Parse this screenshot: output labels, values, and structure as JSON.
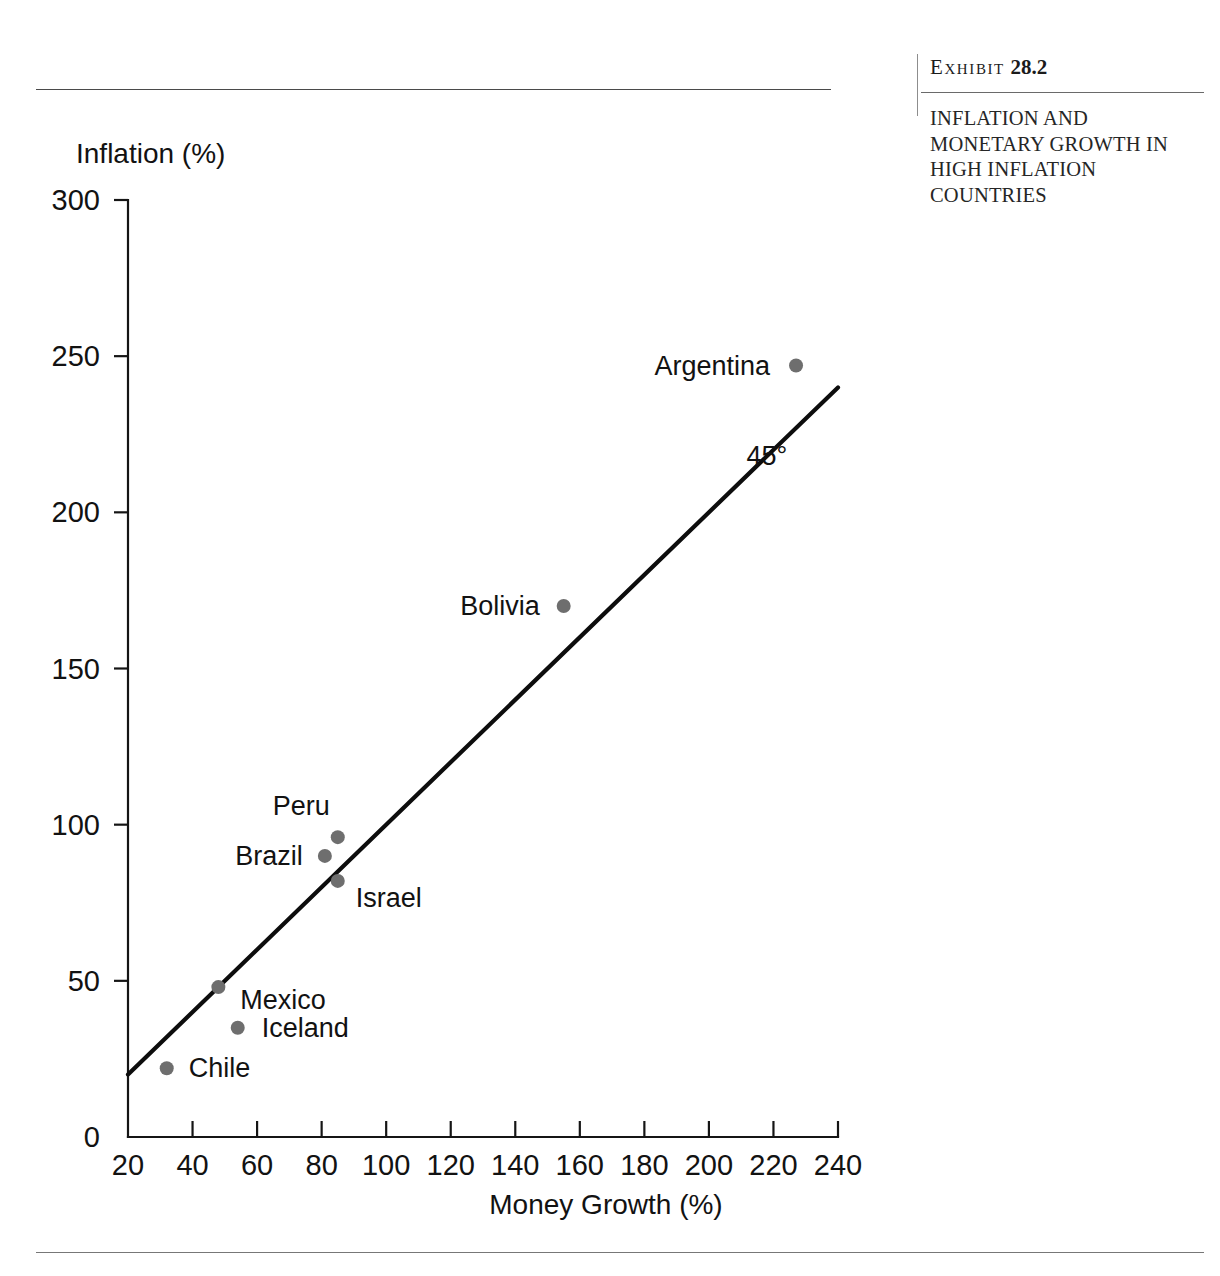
{
  "exhibit": {
    "label_word": "Exhibit",
    "label_number": "28.2",
    "title": "INFLATION AND MONETARY GROWTH IN HIGH INFLATION COUNTRIES"
  },
  "chart_data": {
    "type": "scatter",
    "title": "INFLATION AND MONETARY GROWTH IN HIGH INFLATION COUNTRIES",
    "xlabel": "Money Growth (%)",
    "ylabel": "Inflation (%)",
    "xlim": [
      20,
      240
    ],
    "ylim": [
      0,
      300
    ],
    "xticks": [
      20,
      40,
      60,
      80,
      100,
      120,
      140,
      160,
      180,
      200,
      220,
      240
    ],
    "yticks": [
      0,
      50,
      100,
      150,
      200,
      250,
      300
    ],
    "xtick_labels": [
      "20",
      "40",
      "60",
      "80",
      "100",
      "120",
      "140",
      "160",
      "180",
      "200",
      "220",
      "240"
    ],
    "ytick_labels": [
      "0",
      "50",
      "100",
      "150",
      "200",
      "250",
      "300"
    ],
    "grid": false,
    "legend": false,
    "points": [
      {
        "name": "Chile",
        "x": 32,
        "y": 22,
        "label_dx": 22,
        "label_dy": 9,
        "anchor": "start"
      },
      {
        "name": "Iceland",
        "x": 54,
        "y": 35,
        "label_dx": 24,
        "label_dy": 9,
        "anchor": "start"
      },
      {
        "name": "Mexico",
        "x": 48,
        "y": 48,
        "label_dx": 22,
        "label_dy": 22,
        "anchor": "start"
      },
      {
        "name": "Israel",
        "x": 85,
        "y": 82,
        "label_dx": 18,
        "label_dy": 26,
        "anchor": "start"
      },
      {
        "name": "Brazil",
        "x": 81,
        "y": 90,
        "label_dx": -22,
        "label_dy": 9,
        "anchor": "end"
      },
      {
        "name": "Peru",
        "x": 85,
        "y": 96,
        "label_dx": -8,
        "label_dy": -22,
        "anchor": "end"
      },
      {
        "name": "Bolivia",
        "x": 155,
        "y": 170,
        "label_dx": -24,
        "label_dy": 9,
        "anchor": "end"
      },
      {
        "name": "Argentina",
        "x": 227,
        "y": 247,
        "label_dx": -26,
        "label_dy": 9,
        "anchor": "end"
      }
    ],
    "reference_line": {
      "label": "45°",
      "from": [
        20,
        20
      ],
      "to": [
        240,
        240
      ],
      "label_x": 218,
      "label_y": 215
    }
  }
}
